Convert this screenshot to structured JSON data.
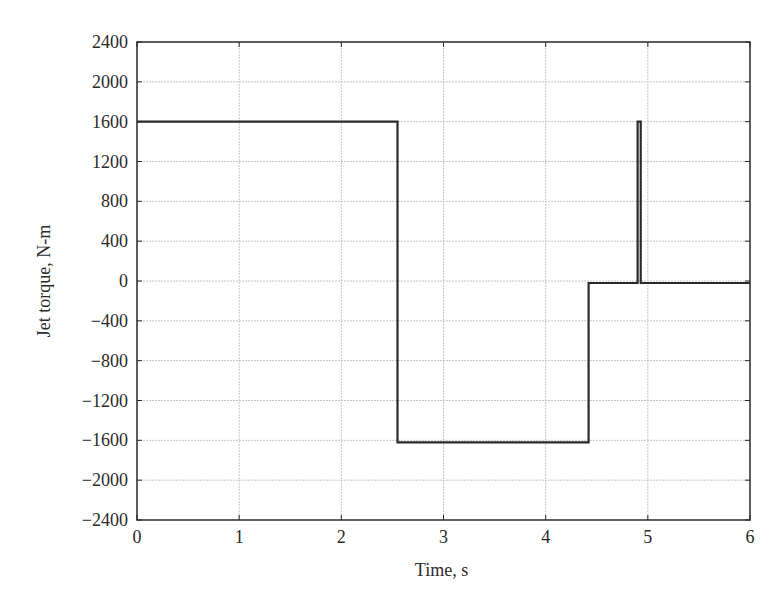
{
  "chart_data": {
    "type": "line",
    "title": "",
    "xlabel": "Time, s",
    "ylabel": "Jet torque, N-m",
    "xlim": [
      0,
      6
    ],
    "ylim": [
      -2400,
      2400
    ],
    "xticks": [
      0,
      1,
      2,
      3,
      4,
      5,
      6
    ],
    "yticks": [
      2400,
      2000,
      1600,
      1200,
      800,
      400,
      0,
      -400,
      -800,
      -1200,
      -1600,
      -2000,
      -2400
    ],
    "ytick_labels": [
      "2400",
      "2000",
      "1600",
      "1200",
      "800",
      "400",
      "0",
      "−400",
      "−800",
      "−1200",
      "−1600",
      "−2000",
      "−2400"
    ],
    "grid": true,
    "legend": null,
    "series": [
      {
        "name": "Jet torque",
        "color": "#2a2a2a",
        "x": [
          0,
          2.55,
          2.55,
          4.42,
          4.42,
          4.9,
          4.9,
          4.93,
          4.93,
          6.0
        ],
        "y": [
          1600,
          1600,
          -1620,
          -1620,
          -20,
          -20,
          1600,
          1600,
          -20,
          -20
        ]
      }
    ]
  },
  "colors": {
    "line": "#2a2a2a",
    "grid": "#b8b8b8",
    "axes": "#2a2a2a",
    "background": "#ffffff"
  }
}
